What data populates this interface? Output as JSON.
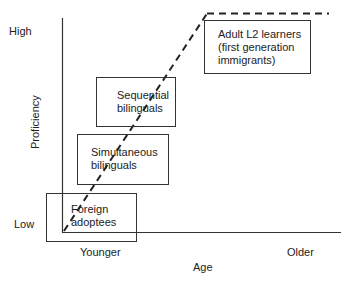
{
  "diagram": {
    "x_axis": {
      "title": "Age",
      "low_label": "Younger",
      "high_label": "Older"
    },
    "y_axis": {
      "title": "Proficiency",
      "low_label": "Low",
      "high_label": "High"
    },
    "groups": [
      {
        "id": "foreign-adoptees",
        "line1": "Foreign",
        "line2": "adoptees",
        "line3": ""
      },
      {
        "id": "simultaneous-bilinguals",
        "line1": "Simultaneous",
        "line2": "bilinguals",
        "line3": ""
      },
      {
        "id": "sequential-bilinguals",
        "line1": "Sequential",
        "line2": "bilinguals",
        "line3": ""
      },
      {
        "id": "adult-l2-learners",
        "line1": "Adult L2 learners",
        "line2": "(first generation",
        "line3": "immigrants)"
      }
    ],
    "trend_line": {
      "style": "dashed",
      "description": "Proficiency rises with age of acquisition group, then plateaus at high"
    },
    "colors": {
      "line": "#222222",
      "axis": "#333333",
      "background": "#ffffff"
    }
  }
}
